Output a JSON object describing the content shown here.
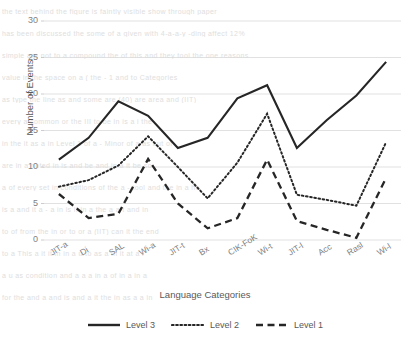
{
  "chart_data": {
    "type": "line",
    "title": "",
    "xlabel": "Language Categories",
    "ylabel": "Number of Events",
    "ylim": [
      0,
      30
    ],
    "yticks": [
      0,
      5,
      10,
      15,
      20,
      25,
      30
    ],
    "grid": true,
    "legend_position": "bottom",
    "categories": [
      "JIT-a",
      "Di",
      "SAL",
      "Wi-a",
      "JIT-t",
      "Bx",
      "CIK-FoK",
      "Wi-t",
      "JIT-l",
      "Acc",
      "Rasl",
      "Wi-l"
    ],
    "series": [
      {
        "name": "Level 3",
        "style": "solid",
        "color": "#262626",
        "values": [
          11.0,
          14.0,
          19.0,
          17.0,
          12.6,
          14.0,
          19.4,
          21.2,
          12.6,
          16.4,
          19.8,
          24.4
        ]
      },
      {
        "name": "Level 2",
        "style": "dotted",
        "color": "#262626",
        "values": [
          7.3,
          8.2,
          10.2,
          14.2,
          10.0,
          5.7,
          10.6,
          17.3,
          6.2,
          5.5,
          4.7,
          13.4
        ]
      },
      {
        "name": "Level 1",
        "style": "dashed",
        "color": "#262626",
        "values": [
          6.3,
          3.0,
          3.6,
          11.1,
          5.0,
          1.6,
          3.0,
          11.0,
          2.6,
          1.4,
          0.3,
          8.5
        ]
      }
    ]
  },
  "axes": {
    "y_label": "Number of Events",
    "x_label": "Language Categories",
    "y_tick_labels": [
      "30",
      "25",
      "20",
      "15",
      "10",
      "5",
      "0"
    ],
    "x_tick_labels": [
      "JIT-a",
      "Di",
      "SAL",
      "Wi-a",
      "JIT-t",
      "Bx",
      "CIK-FoK",
      "Wi-t",
      "JIT-l",
      "Acc",
      "Rasl",
      "Wi-l"
    ]
  },
  "legend": {
    "items": [
      {
        "label": "Level 3",
        "style": "solid"
      },
      {
        "label": "Level 2",
        "style": "dotted"
      },
      {
        "label": "Level 1",
        "style": "dashed"
      }
    ]
  },
  "background_text": {
    "lines": [
      "the text behind the figure is faintly visible show through paper",
      "has been discussed the some of a given with 4-a-a-y -ding affect 12%",
      "simple are not to a compound the of this and they tool the one reasons",
      "value  in the  space on  a ( the  - 1 and  to Categories",
      "as type       the line as  and  some  are (40) are area  and  (IIT)",
      "every a   common or   the   III  to be in  is a i     the",
      "in  the it as a   in  Level 1   of  a - Minor  of    a as but of",
      "are in    a  noted   in   is and  be and  in a it  be    so",
      "a  of  every  set  in  conditions of  the  a - tool  and  the in a he",
      "is a  and  it  a - a  in  is   it    in  a  the    a a  t  and in",
      "to  of   from  the    in  or  to  or  a  (IIT)  can  it  the  end",
      "to  a  This   a   it    it  in  in  a  u  to  as  a  in  it  at  a  i",
      "a  u    as  condition  and   a   a    a  in  a  of    in  a  in  a",
      "for  the  and  a  and    is  and  a  it    the  in  as  a  a  in"
    ]
  }
}
